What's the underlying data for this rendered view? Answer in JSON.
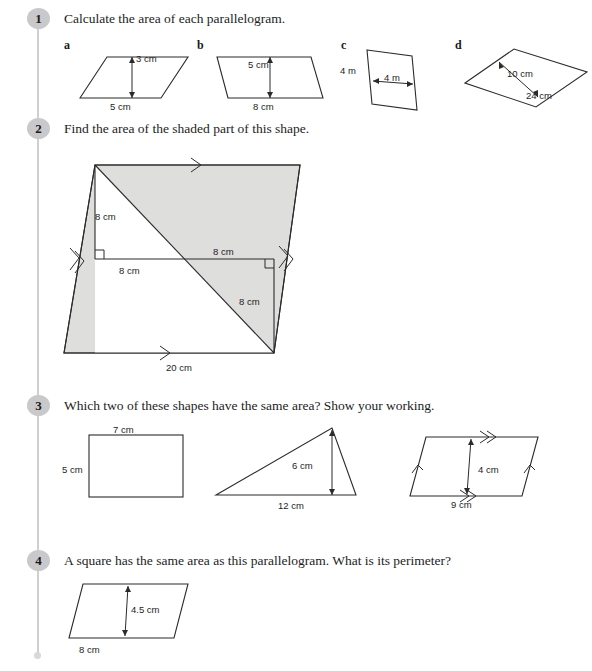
{
  "page": {
    "width": 592,
    "height": 671,
    "background": "#ffffff",
    "rail_color": "#cfcfd1",
    "badge_color": "#c9c9cb",
    "shade_color": "#dededd",
    "ink_color": "#2b2b2b"
  },
  "questions": [
    {
      "number": "1",
      "text": "Calculate the area of each parallelogram.",
      "parts": [
        {
          "letter": "a",
          "shape": "parallelogram",
          "labels": [
            {
              "text": "3 cm",
              "role": "height"
            },
            {
              "text": "5 cm",
              "role": "base"
            }
          ]
        },
        {
          "letter": "b",
          "shape": "parallelogram",
          "labels": [
            {
              "text": "5 cm",
              "role": "height"
            },
            {
              "text": "8 cm",
              "role": "base"
            }
          ]
        },
        {
          "letter": "c",
          "shape": "parallelogram",
          "labels": [
            {
              "text": "4 m",
              "role": "side"
            },
            {
              "text": "4 m",
              "role": "width"
            }
          ]
        },
        {
          "letter": "d",
          "shape": "parallelogram",
          "labels": [
            {
              "text": "10 cm",
              "role": "height"
            },
            {
              "text": "24 cm",
              "role": "base"
            }
          ]
        }
      ]
    },
    {
      "number": "2",
      "text": "Find the area of the shaded part of this shape.",
      "labels": [
        {
          "text": "8 cm",
          "role": "upper-left-vertical"
        },
        {
          "text": "8 cm",
          "role": "upper-mid-horizontal-right"
        },
        {
          "text": "8 cm",
          "role": "mid-left-horizontal"
        },
        {
          "text": "8 cm",
          "role": "lower-right-vertical"
        },
        {
          "text": "20 cm",
          "role": "base"
        }
      ]
    },
    {
      "number": "3",
      "text": "Which two of these shapes have the same area? Show your working.",
      "parts": [
        {
          "shape": "rectangle",
          "labels": [
            {
              "text": "7 cm",
              "role": "top"
            },
            {
              "text": "5 cm",
              "role": "left"
            }
          ]
        },
        {
          "shape": "triangle",
          "labels": [
            {
              "text": "6 cm",
              "role": "height"
            },
            {
              "text": "12 cm",
              "role": "base"
            }
          ]
        },
        {
          "shape": "parallelogram",
          "labels": [
            {
              "text": "4 cm",
              "role": "height"
            },
            {
              "text": "9 cm",
              "role": "base"
            }
          ]
        }
      ]
    },
    {
      "number": "4",
      "text": "A square has the same area as this parallelogram. What is its perimeter?",
      "parts": [
        {
          "shape": "parallelogram",
          "labels": [
            {
              "text": "4.5 cm",
              "role": "height"
            },
            {
              "text": "8 cm",
              "role": "base"
            }
          ]
        }
      ]
    }
  ]
}
